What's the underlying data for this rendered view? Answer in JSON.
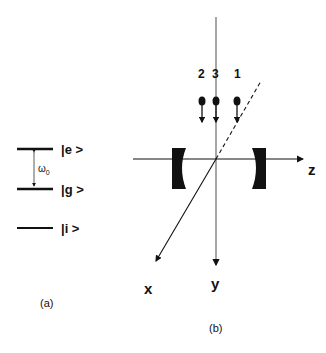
{
  "panel_a": {
    "caption": "(a)",
    "levels": [
      {
        "label": "|e >",
        "y": 149
      },
      {
        "label": "|g >",
        "y": 189
      },
      {
        "label": "|i >",
        "y": 228
      }
    ],
    "transition_label": "ω",
    "transition_sub": "0"
  },
  "panel_b": {
    "caption": "(b)",
    "axes": {
      "x": "x",
      "y": "y",
      "z": "z"
    },
    "atoms": [
      {
        "label": "2",
        "x": 202
      },
      {
        "label": "3",
        "x": 216
      },
      {
        "label": "1",
        "x": 237
      }
    ]
  },
  "colors": {
    "ink": "#111111",
    "axis_gray": "#888888"
  }
}
